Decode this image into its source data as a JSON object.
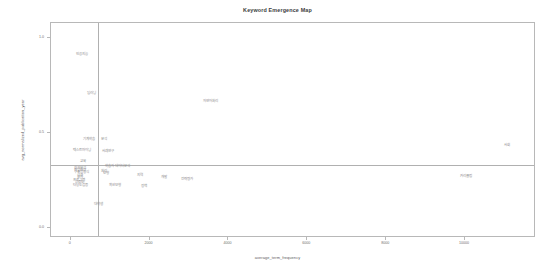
{
  "chart_data": {
    "type": "scatter",
    "title": "Keyword Emergence Map",
    "xlabel": "average_term_frequency",
    "ylabel": "avg_normalized_publication_year",
    "xlim": [
      -500,
      11800
    ],
    "ylim": [
      -0.05,
      1.08
    ],
    "grid": false,
    "legend": null,
    "xticks": [
      0,
      2000,
      4000,
      6000,
      8000,
      10000
    ],
    "xticklabels": [
      "0",
      "2000",
      "4000",
      "6000",
      "8000",
      "10000"
    ],
    "yticks": [
      0.0,
      0.5,
      1.0
    ],
    "yticklabels": [
      "0.0",
      "0.5",
      "1.0"
    ],
    "reference_lines": {
      "vertical_x": 700,
      "horizontal_y": 0.335
    },
    "points": [
      {
        "label": "인공지능",
        "x": 320,
        "y": 0.905
      },
      {
        "label": "딥러닝",
        "x": 560,
        "y": 0.7
      },
      {
        "label": "자연어처리",
        "x": 3570,
        "y": 0.66
      },
      {
        "label": "기계학습",
        "x": 500,
        "y": 0.46
      },
      {
        "label": "텍스트마이닝",
        "x": 320,
        "y": 0.4
      },
      {
        "label": "분석",
        "x": 860,
        "y": 0.46
      },
      {
        "label": "사례연구",
        "x": 960,
        "y": 0.395
      },
      {
        "label": "교육",
        "x": 330,
        "y": 0.345
      },
      {
        "label": "학습자",
        "x": 1010,
        "y": 0.32
      },
      {
        "label": "데이터분석",
        "x": 1350,
        "y": 0.32
      },
      {
        "label": "회귀분석",
        "x": 260,
        "y": 0.31
      },
      {
        "label": "산업현장",
        "x": 270,
        "y": 0.298
      },
      {
        "label": "구조방정식",
        "x": 300,
        "y": 0.288
      },
      {
        "label": "처리",
        "x": 880,
        "y": 0.29
      },
      {
        "label": "모형",
        "x": 930,
        "y": 0.282
      },
      {
        "label": "성과",
        "x": 250,
        "y": 0.27
      },
      {
        "label": "오차",
        "x": 250,
        "y": 0.258
      },
      {
        "label": "프로그램",
        "x": 240,
        "y": 0.245
      },
      {
        "label": "신뢰도",
        "x": 250,
        "y": 0.235
      },
      {
        "label": "타당도검증",
        "x": 270,
        "y": 0.22
      },
      {
        "label": "확산모형",
        "x": 1150,
        "y": 0.218
      },
      {
        "label": "지역",
        "x": 1780,
        "y": 0.268
      },
      {
        "label": "개발",
        "x": 2400,
        "y": 0.258
      },
      {
        "label": "전략",
        "x": 2900,
        "y": 0.252
      },
      {
        "label": "정책",
        "x": 1880,
        "y": 0.215
      },
      {
        "label": "평가",
        "x": 3050,
        "y": 0.25
      },
      {
        "label": "대학생",
        "x": 740,
        "y": 0.12
      },
      {
        "label": "커리큘럼",
        "x": 10050,
        "y": 0.265
      },
      {
        "label": "사회",
        "x": 11100,
        "y": 0.43
      }
    ]
  }
}
